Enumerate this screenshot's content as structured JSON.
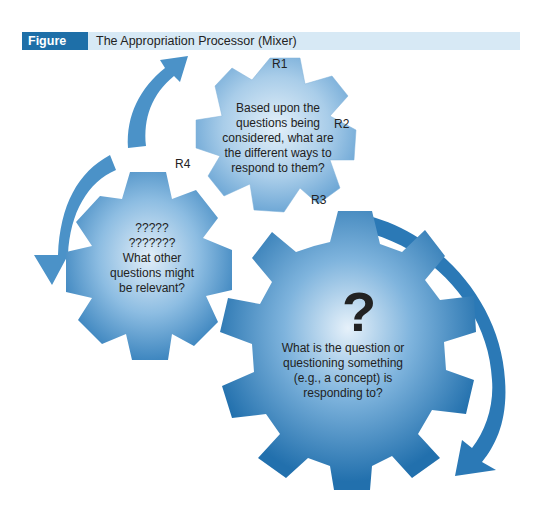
{
  "figure": {
    "label": "Figure 2.3",
    "title": "The Appropriation Processor (Mixer)"
  },
  "colors": {
    "header_label_bg": "#1e6fa8",
    "header_bg": "#d7e9f5",
    "gear_light": "#8fbde0",
    "gear_mid": "#5a9bcc",
    "gear_dark": "#2a79b4",
    "arrow": "#3a86bf"
  },
  "gears": {
    "top": {
      "text": "Based upon the questions being considered, what are the different ways to respond to them?",
      "labels": [
        "R1",
        "R2",
        "R3",
        "R4"
      ]
    },
    "left": {
      "line1": "?????",
      "line2": "???????",
      "text": "What other questions might be relevant?"
    },
    "big": {
      "symbol": "?",
      "text": "What is the question or questioning something (e.g., a concept) is responding to?"
    }
  }
}
